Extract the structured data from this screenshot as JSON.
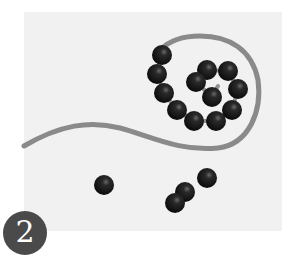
{
  "figure": {
    "panel_label": "2",
    "colors": {
      "background": "#ffffff",
      "panel": "#f1f1f1",
      "strand": "#8a8a8a",
      "bead": "#111111",
      "linker": "#8f8f8f",
      "badge": "#4a4a4a",
      "badge_text": "#ffffff"
    },
    "coiled_beads": [
      {
        "x": 162,
        "y": 55
      },
      {
        "x": 157,
        "y": 74
      },
      {
        "x": 164,
        "y": 93
      },
      {
        "x": 177,
        "y": 110
      },
      {
        "x": 194,
        "y": 121
      },
      {
        "x": 216,
        "y": 121
      },
      {
        "x": 232,
        "y": 110
      },
      {
        "x": 238,
        "y": 89
      },
      {
        "x": 228,
        "y": 71
      },
      {
        "x": 207,
        "y": 70
      },
      {
        "x": 196,
        "y": 82
      },
      {
        "x": 212,
        "y": 97
      }
    ],
    "free_beads": [
      {
        "x": 104,
        "y": 185
      },
      {
        "x": 207,
        "y": 178
      },
      {
        "x": 185,
        "y": 192
      },
      {
        "x": 175,
        "y": 203
      }
    ]
  }
}
